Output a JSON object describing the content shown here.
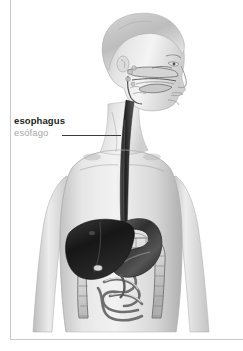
{
  "figure": {
    "view": "head in right profile with frontal torso, cutaway viscera",
    "palette": {
      "background": "#ffffff",
      "label_primary": "#231f20",
      "label_secondary": "#a6a8ab",
      "leader_line": "#3b3b3b",
      "rule": "#c9c9c9",
      "skin_light": "#ededed",
      "skin_mid": "#d2d2d2",
      "skin_shadow": "#a9a9a9",
      "liver_dark": "#1c1c1c",
      "stomach": "#4a4a4a",
      "esophagus": "#2e2e2e",
      "intestine_light": "#e2e2e2",
      "intestine_outline": "#6d6d6d"
    }
  },
  "callout": {
    "label_en": "esophagus",
    "label_es": "esófago",
    "leader_from_x": 62,
    "leader_to_x": 121,
    "leader_y": 135,
    "points_to": "esophagus"
  },
  "anatomy": {
    "parts": [
      "head-profile",
      "nasal-cavity",
      "oral-cavity",
      "tongue",
      "pharynx",
      "neck",
      "shoulders",
      "left-arm",
      "right-arm",
      "esophagus",
      "liver",
      "stomach",
      "gallbladder",
      "large-intestine",
      "small-intestine"
    ]
  },
  "rules": {
    "margin_rule_visible": true,
    "bottom_rule_visible": true
  }
}
